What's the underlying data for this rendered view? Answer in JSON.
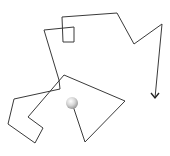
{
  "drawing": {
    "type": "turtle-path",
    "stroke_color": "#3a3a3a",
    "start": {
      "x": 72,
      "y": 103,
      "label": "sphere"
    },
    "points": [
      [
        72,
        103
      ],
      [
        85,
        142
      ],
      [
        125,
        101
      ],
      [
        64,
        75
      ],
      [
        28,
        117
      ],
      [
        43,
        128
      ],
      [
        35,
        143
      ],
      [
        8,
        124
      ],
      [
        14,
        99
      ],
      [
        60,
        89
      ],
      [
        59,
        80
      ],
      [
        44,
        30
      ],
      [
        74,
        27
      ],
      [
        74,
        42
      ],
      [
        63,
        42
      ],
      [
        62,
        17
      ],
      [
        117,
        13
      ],
      [
        134,
        44
      ],
      [
        162,
        24
      ],
      [
        155,
        98
      ]
    ],
    "end_arrow": {
      "x": 155,
      "y": 98,
      "direction": "down"
    },
    "sphere": {
      "cx": 72,
      "cy": 103,
      "r": 6,
      "color_light": "#f4f4f4",
      "color_dark": "#a8a8a8"
    }
  }
}
